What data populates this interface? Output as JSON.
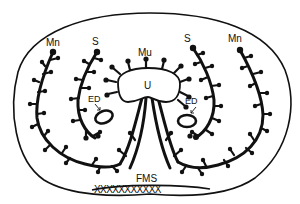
{
  "figure": {
    "labels": {
      "mn_left": "Mn",
      "s_left": "S",
      "mu": "Mu",
      "u": "U",
      "s_right": "S",
      "mn_right": "Mn",
      "ed_left": "ED",
      "ed_right": "ED",
      "fms": "FMS"
    },
    "x_marks": "XXXXXXXXXXX",
    "colors": {
      "ink": "#111111",
      "background": "#ffffff"
    }
  }
}
